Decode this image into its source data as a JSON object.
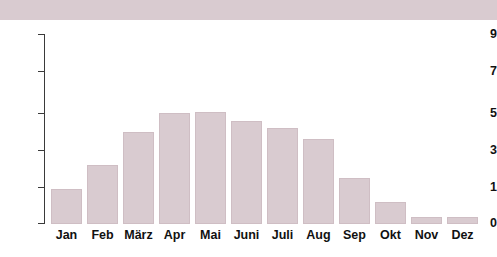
{
  "chart_data": {
    "type": "bar",
    "title": "Stunden",
    "xlabel": "",
    "ylabel": "Stunden",
    "categories": [
      "Jan",
      "Feb",
      "März",
      "Apr",
      "Mai",
      "Juni",
      "Juli",
      "Aug",
      "Sep",
      "Okt",
      "Nov",
      "Dez"
    ],
    "values": [
      1.1,
      1.9,
      3.2,
      5.0,
      6.0,
      6.05,
      5.6,
      5.2,
      4.6,
      2.5,
      1.2,
      0.4
    ],
    "ylim": [
      0,
      9
    ],
    "ytick_labels": [
      "9",
      "7",
      "5",
      "3",
      "1",
      "0"
    ],
    "ytick_values": [
      9,
      7,
      5,
      3,
      1,
      0
    ],
    "grid": false,
    "legend": null,
    "bar_color": "#d9cbd0",
    "bar_edge_color": "#cfbec4",
    "axis_color": "#3a3a3a",
    "text_color": "#111111",
    "background_color": "#ffffff"
  }
}
